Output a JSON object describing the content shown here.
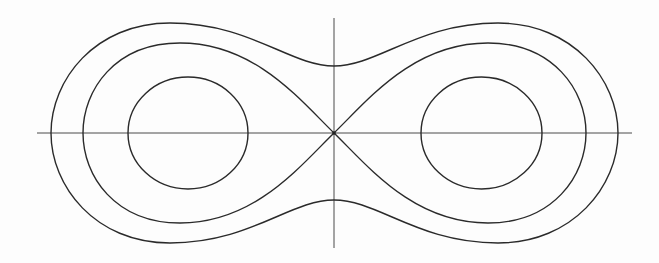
{
  "diagram": {
    "type": "cassini-ovals",
    "colors": {
      "stroke": "#2a2a2a",
      "axis": "#4a4a4a",
      "background": "#fdfdfd"
    },
    "center": [
      334,
      133
    ],
    "axes": {
      "horizontal": {
        "x1": 37,
        "x2": 632,
        "y": 133
      },
      "vertical": {
        "x": 334,
        "y1": 18,
        "y2": 248
      }
    },
    "curves": [
      {
        "name": "outer-peanut-oval",
        "x_extent": [
          51,
          618
        ],
        "y_extent": [
          23,
          243
        ],
        "waist_y": [
          66,
          200
        ]
      },
      {
        "name": "lemniscate",
        "x_extent": [
          83,
          586
        ],
        "y_extent": [
          43,
          223
        ],
        "crossing": [
          334,
          133
        ]
      },
      {
        "name": "left-inner-oval",
        "x_extent": [
          128,
          248
        ],
        "y_extent": [
          77,
          189
        ]
      },
      {
        "name": "right-inner-oval",
        "x_extent": [
          421,
          542
        ],
        "y_extent": [
          77,
          189
        ]
      }
    ]
  }
}
